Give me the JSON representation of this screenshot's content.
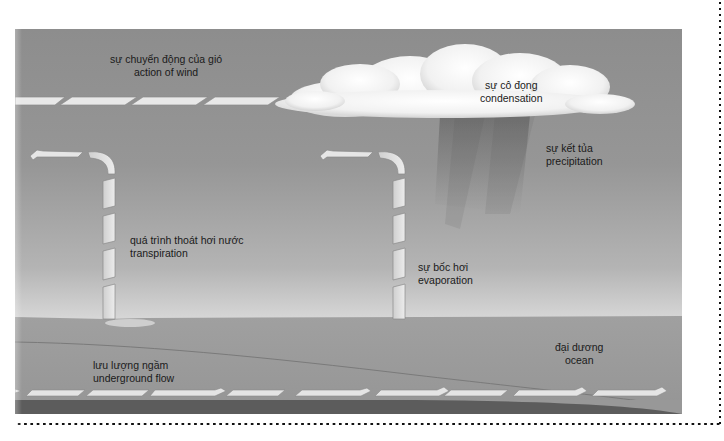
{
  "diagram": {
    "labels": {
      "wind": {
        "vi": "sự chuyển động của gió",
        "en": "action of wind"
      },
      "condensation": {
        "vi": "sự cô đọng",
        "en": "condensation"
      },
      "precipitation": {
        "vi": "sự kết tủa",
        "en": "precipitation"
      },
      "transpiration": {
        "vi": "quá trình thoát hơi nước",
        "en": "transpiration"
      },
      "evaporation": {
        "vi": "sự bốc hơi",
        "en": "evaporation"
      },
      "ocean": {
        "vi": "đại dương",
        "en": "ocean"
      },
      "underground_flow": {
        "vi": "lưu lượng ngầm",
        "en": "underground flow"
      }
    },
    "icons": {
      "wind_arrows": "wind-arrow-icon",
      "cloud": "cloud-icon",
      "rain": "rain-shading-icon",
      "transpiration_arrow": "up-then-left-arrow-icon",
      "evaporation_arrow": "up-then-left-arrow-icon",
      "underground_arrows": "right-arrow-icon"
    },
    "colors": {
      "sky_top": "#8d8d8d",
      "sky_bottom": "#dcdcdc",
      "ground": "#9c9c9c",
      "bedrock": "#5a5a5a",
      "arrow_fill": "#e6e6e6",
      "cloud": "#f4f4f4",
      "text": "#1a1a1a"
    }
  }
}
